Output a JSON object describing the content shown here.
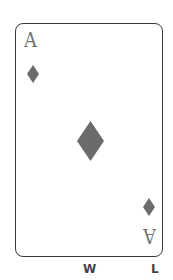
{
  "card": {
    "rank": "A",
    "suit": "diamond",
    "suit_color": "#6b6b6b",
    "border_color": "#3a3a3a"
  },
  "labels": {
    "left": "W",
    "right": "L"
  }
}
